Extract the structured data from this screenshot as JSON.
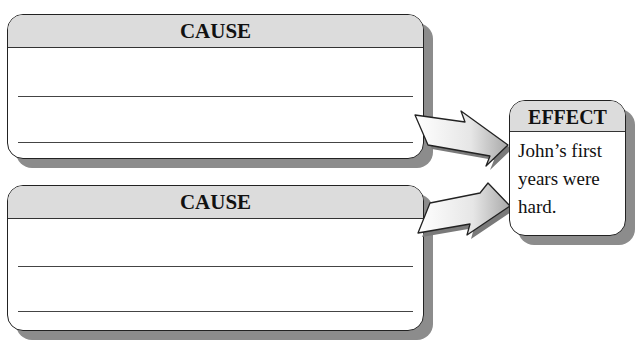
{
  "diagram": {
    "type": "cause-effect organizer",
    "causes": [
      {
        "label": "CAUSE",
        "lines": [
          "",
          ""
        ]
      },
      {
        "label": "CAUSE",
        "lines": [
          "",
          ""
        ]
      }
    ],
    "effect": {
      "label": "EFFECT",
      "text": "John’s first years were hard."
    },
    "colors": {
      "header_fill": "#dcdcdc",
      "shadow": "#8c8c8c",
      "border": "#222222"
    }
  }
}
